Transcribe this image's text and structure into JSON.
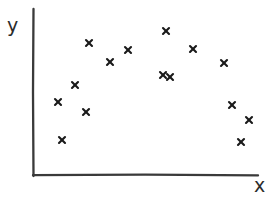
{
  "figure": {
    "width": 275,
    "height": 198,
    "background_color": "#ffffff",
    "style": "hand-drawn sketch"
  },
  "axes": {
    "y_label": "y",
    "x_label": "x",
    "line_color": "#3a3a3a",
    "origin_px": [
      33,
      175
    ],
    "y_axis_top_px": [
      33,
      9
    ],
    "x_axis_right_px": [
      258,
      175
    ],
    "show_ticks": false,
    "show_grid": false
  },
  "marker": {
    "glyph": "x",
    "color": "#1a1a1a",
    "size_px": 6
  },
  "chart_data": {
    "type": "scatter",
    "title": "",
    "subtitle": "",
    "xlabel": "x",
    "ylabel": "y",
    "grid": false,
    "legend": null,
    "xlim": [
      0,
      1
    ],
    "ylim": [
      0,
      1
    ],
    "series": [
      {
        "name": "points",
        "marker": "x",
        "color": "#1a1a1a",
        "points_px": [
          [
            62,
            140
          ],
          [
            58,
            102
          ],
          [
            86,
            112
          ],
          [
            75,
            85
          ],
          [
            89,
            43
          ],
          [
            110,
            62
          ],
          [
            128,
            50
          ],
          [
            163,
            75
          ],
          [
            170,
            77
          ],
          [
            166,
            31
          ],
          [
            193,
            49
          ],
          [
            224,
            63
          ],
          [
            232,
            105
          ],
          [
            249,
            120
          ],
          [
            241,
            142
          ]
        ],
        "x": [
          0.129,
          0.111,
          0.236,
          0.187,
          0.249,
          0.342,
          0.422,
          0.578,
          0.609,
          0.591,
          0.711,
          0.849,
          0.885,
          0.96,
          0.924
        ],
        "y": [
          0.211,
          0.44,
          0.38,
          0.542,
          0.795,
          0.681,
          0.753,
          0.602,
          0.59,
          0.867,
          0.759,
          0.675,
          0.422,
          0.331,
          0.199
        ]
      }
    ],
    "n_points": 15,
    "shape_description": "inverted-U / arch distribution"
  }
}
